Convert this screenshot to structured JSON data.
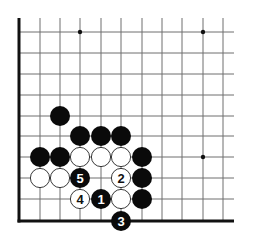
{
  "diagram": {
    "type": "go-board",
    "title": "",
    "region": "lower-left corner",
    "columns": 11,
    "rows": 10,
    "grid": {
      "x": [
        19,
        40,
        60,
        80,
        101,
        121,
        142,
        162,
        182,
        203,
        223
      ],
      "y": [
        32,
        53,
        74,
        95,
        116,
        136,
        157,
        178,
        199,
        221
      ],
      "right_extent": 234,
      "top_extent": 18,
      "edges": [
        "left",
        "bottom"
      ]
    },
    "colors": {
      "line": "#6e6e6e",
      "edge": "#111111",
      "black_stone": "#0a0a0a",
      "white_stone": "#ffffff",
      "white_stroke": "#222222",
      "star": "#111111"
    },
    "star_points": [
      {
        "col": 3,
        "row": 0
      },
      {
        "col": 9,
        "row": 0
      },
      {
        "col": 9,
        "row": 6
      }
    ],
    "stones": [
      {
        "color": "black",
        "col": 2,
        "row": 4,
        "label": ""
      },
      {
        "color": "black",
        "col": 3,
        "row": 5,
        "label": ""
      },
      {
        "color": "black",
        "col": 4,
        "row": 5,
        "label": ""
      },
      {
        "color": "black",
        "col": 5,
        "row": 5,
        "label": ""
      },
      {
        "color": "black",
        "col": 1,
        "row": 6,
        "label": ""
      },
      {
        "color": "black",
        "col": 2,
        "row": 6,
        "label": ""
      },
      {
        "color": "white",
        "col": 3,
        "row": 6,
        "label": ""
      },
      {
        "color": "white",
        "col": 4,
        "row": 6,
        "label": ""
      },
      {
        "color": "white",
        "col": 5,
        "row": 6,
        "label": ""
      },
      {
        "color": "black",
        "col": 6,
        "row": 6,
        "label": ""
      },
      {
        "color": "white",
        "col": 1,
        "row": 7,
        "label": ""
      },
      {
        "color": "white",
        "col": 2,
        "row": 7,
        "label": ""
      },
      {
        "color": "black",
        "col": 3,
        "row": 7,
        "label": "5"
      },
      {
        "color": "white",
        "col": 5,
        "row": 7,
        "label": "2"
      },
      {
        "color": "black",
        "col": 6,
        "row": 7,
        "label": ""
      },
      {
        "color": "white",
        "col": 3,
        "row": 8,
        "label": "4"
      },
      {
        "color": "black",
        "col": 4,
        "row": 8,
        "label": "1"
      },
      {
        "color": "white",
        "col": 5,
        "row": 8,
        "label": ""
      },
      {
        "color": "black",
        "col": 6,
        "row": 8,
        "label": ""
      },
      {
        "color": "black",
        "col": 5,
        "row": 9,
        "label": "3"
      }
    ],
    "move_sequence": [
      {
        "move": "1",
        "color": "black"
      },
      {
        "move": "2",
        "color": "white"
      },
      {
        "move": "3",
        "color": "black"
      },
      {
        "move": "4",
        "color": "white"
      },
      {
        "move": "5",
        "color": "black"
      }
    ]
  }
}
